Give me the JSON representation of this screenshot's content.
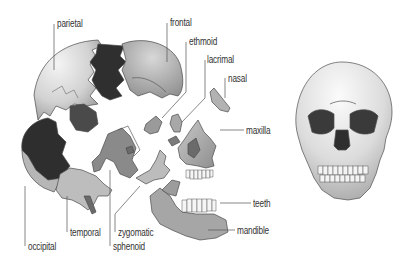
{
  "diagram": {
    "type": "exploded skull anatomy illustration",
    "colors": {
      "background": "#ffffff",
      "bone_light": "#cfcfcf",
      "bone_mid": "#a9a9a9",
      "bone_dark": "#6f6f6f",
      "cavity": "#2e2e2e",
      "outline": "#4a4a4a",
      "leader_line": "#555555",
      "label_text": "#333333"
    },
    "labels": [
      {
        "id": "parietal",
        "text": "parietal",
        "x": 57,
        "y": 18
      },
      {
        "id": "frontal",
        "text": "frontal",
        "x": 170,
        "y": 17
      },
      {
        "id": "ethmoid",
        "text": "ethmoid",
        "x": 189,
        "y": 36
      },
      {
        "id": "lacrimal",
        "text": "lacrimal",
        "x": 207,
        "y": 54
      },
      {
        "id": "nasal",
        "text": "nasal",
        "x": 228,
        "y": 73
      },
      {
        "id": "maxilla",
        "text": "maxilla",
        "x": 246,
        "y": 126
      },
      {
        "id": "teeth",
        "text": "teeth",
        "x": 253,
        "y": 199
      },
      {
        "id": "mandible",
        "text": "mandible",
        "x": 237,
        "y": 227
      },
      {
        "id": "temporal",
        "text": "temporal",
        "x": 70,
        "y": 227
      },
      {
        "id": "zygomatic",
        "text": "zygomatic",
        "x": 118,
        "y": 227
      },
      {
        "id": "occipital",
        "text": "occipital",
        "x": 28,
        "y": 242
      },
      {
        "id": "sphenoid",
        "text": "sphenoid",
        "x": 113,
        "y": 242
      }
    ],
    "figures": [
      {
        "id": "exploded-skull",
        "description": "side view of skull separated into individual bones"
      },
      {
        "id": "assembled-skull",
        "description": "front view of complete skull"
      }
    ]
  }
}
